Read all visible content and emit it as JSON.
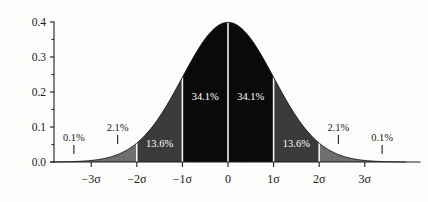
{
  "chart_data": {
    "type": "area",
    "title": "",
    "subtitle": "",
    "xlabel": "",
    "ylabel": "",
    "distribution": "standard normal probability density",
    "formula": "phi(x) = exp(-x^2/2)/sqrt(2*pi)",
    "xlim": [
      -3.9,
      3.9
    ],
    "ylim": [
      0.0,
      0.4
    ],
    "grid": false,
    "legend": null,
    "x_ticks": [
      {
        "value": -3,
        "label": "−3σ"
      },
      {
        "value": -2,
        "label": "−2σ"
      },
      {
        "value": -1,
        "label": "−1σ"
      },
      {
        "value": 0,
        "label": "0"
      },
      {
        "value": 1,
        "label": "1σ"
      },
      {
        "value": 2,
        "label": "2σ"
      },
      {
        "value": 3,
        "label": "3σ"
      }
    ],
    "y_ticks": [
      {
        "value": 0.0,
        "label": "0.0"
      },
      {
        "value": 0.1,
        "label": "0.1"
      },
      {
        "value": 0.2,
        "label": "0.2"
      },
      {
        "value": 0.3,
        "label": "0.3"
      },
      {
        "value": 0.4,
        "label": "0.4"
      }
    ],
    "y_minor_ticks": [
      0.05,
      0.15,
      0.25,
      0.35
    ],
    "regions": [
      {
        "name": "below-3-sigma",
        "from": -3.9,
        "to": -3.0,
        "label": "0.1%",
        "shade": "light",
        "label_color": "dark",
        "label_inside": false
      },
      {
        "name": "minus-3-to-2",
        "from": -3.0,
        "to": -2.0,
        "label": "2.1%",
        "shade": "light",
        "label_color": "dark",
        "label_inside": false
      },
      {
        "name": "minus-2-to-1",
        "from": -2.0,
        "to": -1.0,
        "label": "13.6%",
        "shade": "medium",
        "label_color": "white",
        "label_inside": true
      },
      {
        "name": "minus-1-to-0",
        "from": -1.0,
        "to": 0.0,
        "label": "34.1%",
        "shade": "dark",
        "label_color": "white",
        "label_inside": true
      },
      {
        "name": "zero-to-1",
        "from": 0.0,
        "to": 1.0,
        "label": "34.1%",
        "shade": "dark",
        "label_color": "white",
        "label_inside": true
      },
      {
        "name": "plus-1-to-2",
        "from": 1.0,
        "to": 2.0,
        "label": "13.6%",
        "shade": "medium",
        "label_color": "white",
        "label_inside": true
      },
      {
        "name": "plus-2-to-3",
        "from": 2.0,
        "to": 3.0,
        "label": "2.1%",
        "shade": "light",
        "label_color": "dark",
        "label_inside": false
      },
      {
        "name": "above-3-sigma",
        "from": 3.0,
        "to": 3.9,
        "label": "0.1%",
        "shade": "light",
        "label_color": "dark",
        "label_inside": false
      }
    ],
    "colors": {
      "curve_fill_dark": "#0a0a0a",
      "curve_fill_medium": "#3b3b3b",
      "curve_fill_light": "#6e6e6e",
      "axis": "#1d1d1d",
      "divider": "#f2f2f2",
      "background": "#fdfdfc",
      "label_dark": "#1a1a1a",
      "label_white": "#ffffff"
    }
  }
}
